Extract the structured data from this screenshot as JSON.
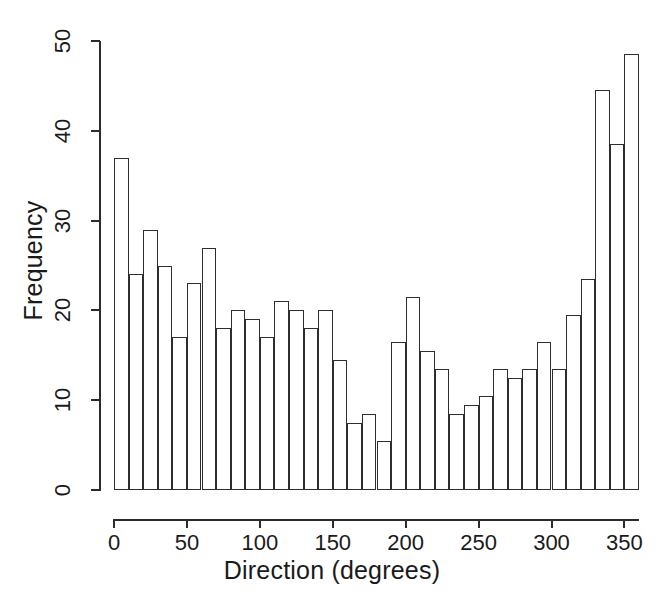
{
  "figure": {
    "background_color": "#ffffff",
    "line_color": "#2e2e2e"
  },
  "chart_data": {
    "type": "bar",
    "title": "",
    "subtitle": "",
    "xlabel": "Direction (degrees)",
    "ylabel": "Frequency",
    "xlim": [
      0,
      360
    ],
    "ylim": [
      0,
      50
    ],
    "grid": false,
    "legend": null,
    "bin_width": 10,
    "bin_count": 36,
    "xticks": [
      0,
      50,
      100,
      150,
      200,
      250,
      300,
      350
    ],
    "xtick_labels": [
      "0",
      "50",
      "100",
      "150",
      "200",
      "250",
      "300",
      "350"
    ],
    "yticks": [
      0,
      10,
      20,
      30,
      40,
      50
    ],
    "ytick_labels": [
      "0",
      "10",
      "20",
      "30",
      "40",
      "50"
    ],
    "categories": [
      "0-10",
      "10-20",
      "20-30",
      "30-40",
      "40-50",
      "50-60",
      "60-70",
      "70-80",
      "80-90",
      "90-100",
      "100-110",
      "110-120",
      "120-130",
      "130-140",
      "140-150",
      "150-160",
      "160-170",
      "170-180",
      "180-190",
      "190-200",
      "200-210",
      "210-220",
      "220-230",
      "230-240",
      "240-250",
      "250-260",
      "260-270",
      "270-280",
      "280-290",
      "290-300",
      "300-310",
      "310-320",
      "320-330",
      "330-340",
      "340-350",
      "350-360"
    ],
    "bin_starts": [
      0,
      10,
      20,
      30,
      40,
      50,
      60,
      70,
      80,
      90,
      100,
      110,
      120,
      130,
      140,
      150,
      160,
      170,
      180,
      190,
      200,
      210,
      220,
      230,
      240,
      250,
      260,
      270,
      280,
      290,
      300,
      310,
      320,
      330,
      340,
      350
    ],
    "values": [
      37,
      24,
      29,
      25,
      17,
      23,
      27,
      18,
      20,
      19,
      17,
      21,
      20,
      18,
      20,
      14.5,
      7.5,
      8.5,
      5.5,
      16.5,
      21.5,
      15.5,
      13.5,
      8.5,
      9.5,
      10.5,
      13.5,
      12.5,
      13.5,
      16.5,
      13.5,
      19.5,
      23.5,
      44.5,
      38.5,
      48.5
    ]
  }
}
